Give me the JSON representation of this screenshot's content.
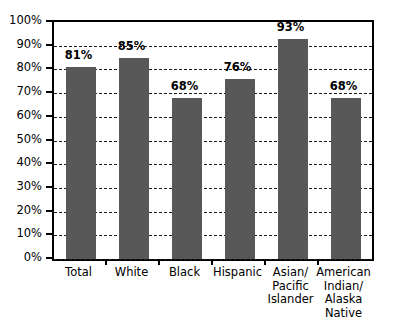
{
  "chart_data": {
    "type": "bar",
    "title": "",
    "subtitle": "",
    "xlabel": "",
    "ylabel": "",
    "categories": [
      "Total",
      "White",
      "Black",
      "Hispanic",
      "Asian/\nPacific\nIslander",
      "American\nIndian/\nAlaska\nNative"
    ],
    "values": [
      81,
      85,
      68,
      76,
      93,
      68
    ],
    "data_labels": [
      "81%",
      "85%",
      "68%",
      "76%",
      "93%",
      "68%"
    ],
    "ylim": [
      0,
      100
    ],
    "ytick_values": [
      0,
      10,
      20,
      30,
      40,
      50,
      60,
      70,
      80,
      90,
      100
    ],
    "ytick_labels": [
      "0%",
      "10%",
      "20%",
      "30%",
      "40%",
      "50%",
      "60%",
      "70%",
      "80%",
      "90%",
      "100%"
    ],
    "grid": true,
    "grid_style": "dashed",
    "legend": false,
    "legend_position": "none",
    "bar_color": "#585858",
    "grid_color": "#1a1a1a",
    "axis_color": "#000000",
    "background_color": "#ffffff"
  }
}
